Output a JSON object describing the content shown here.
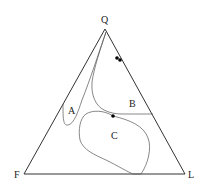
{
  "diagram": {
    "type": "ternary",
    "vertices": {
      "top": "Q",
      "left": "F",
      "right": "L"
    },
    "fields": [
      {
        "label": "A"
      },
      {
        "label": "B"
      },
      {
        "label": "C"
      }
    ],
    "points_count": 3,
    "colors": {
      "lines": "#333333",
      "field_lines": "#555555",
      "points": "#000000",
      "background": "#ffffff"
    }
  }
}
